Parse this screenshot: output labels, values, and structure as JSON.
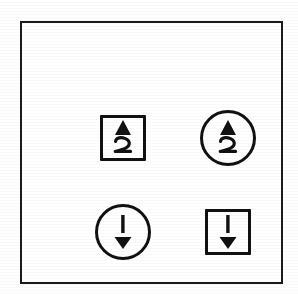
{
  "figure": {
    "background_color": "#ffffff",
    "ink_color": "#111111",
    "frame": {
      "name": "outer border rectangle",
      "stroke_color": "#1b1b1b"
    },
    "symbols": [
      {
        "id": "square-up-wavy",
        "position": "top-left",
        "container_shape": "square",
        "glyph": "up-wavy-arrow",
        "glyph_description": "filled triangle pointing up above a 2-shaped wavy tail",
        "direction": "up",
        "icon_name": "up-wavy-arrow-icon"
      },
      {
        "id": "circle-up-wavy",
        "position": "top-right",
        "container_shape": "circle",
        "glyph": "up-wavy-arrow",
        "glyph_description": "filled triangle pointing up above a 2-shaped wavy tail",
        "direction": "up",
        "icon_name": "up-wavy-arrow-icon"
      },
      {
        "id": "circle-down-straight",
        "position": "bottom-left",
        "container_shape": "circle",
        "glyph": "down-straight-arrow",
        "glyph_description": "straight vertical stroke above a filled triangle pointing down",
        "direction": "down",
        "icon_name": "down-arrow-icon"
      },
      {
        "id": "square-down-straight",
        "position": "bottom-right",
        "container_shape": "square",
        "glyph": "down-straight-arrow",
        "glyph_description": "straight vertical stroke above a filled triangle pointing down",
        "direction": "down",
        "icon_name": "down-arrow-icon"
      }
    ]
  }
}
